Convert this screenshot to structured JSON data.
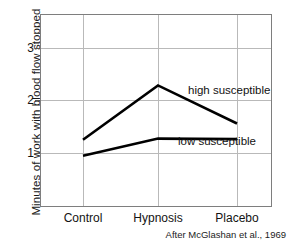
{
  "chart_data": {
    "type": "line",
    "title": "",
    "subtitle": "",
    "xlabel": "",
    "ylabel": "Minutes of work with blood flow stopped",
    "categories": [
      "Control",
      "Hypnosis",
      "Placebo"
    ],
    "ylim": [
      0.0,
      3.7
    ],
    "yticks": [
      1,
      2,
      3
    ],
    "ytick_labels": [
      "1",
      "2",
      "3"
    ],
    "grid": "both",
    "legend_position": "inline-right",
    "series": [
      {
        "name": "high susceptible",
        "values": [
          1.31,
          2.35,
          1.62
        ],
        "color": "#000000"
      },
      {
        "name": "low susceptible",
        "values": [
          1.0,
          1.33,
          1.32
        ],
        "color": "#000000"
      }
    ],
    "annotations": [
      {
        "text": "high susceptible",
        "series": "high susceptible"
      },
      {
        "text": "low susceptible",
        "series": "low susceptible"
      }
    ],
    "source_note": "After McGlashan et al., 1969"
  }
}
